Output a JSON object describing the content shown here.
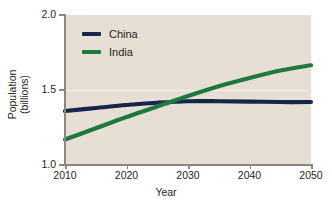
{
  "chart_data": {
    "type": "line",
    "title": "",
    "xlabel": "Year",
    "ylabel": "Population\n(billions)",
    "ylabel_line1": "Population",
    "ylabel_line2": "(billions)",
    "xlim": [
      2010,
      2050
    ],
    "ylim": [
      1.0,
      2.0
    ],
    "xticks": [
      2010,
      2020,
      2030,
      2040,
      2050
    ],
    "xticklabels": [
      "2010",
      "2020",
      "2030",
      "2040",
      "2050"
    ],
    "yticks": [
      1.0,
      1.5,
      2.0
    ],
    "yticklabels": [
      "1.0",
      "1.5",
      "2.0"
    ],
    "grid": "horizontal-faint",
    "legend_position": "top-left-inside",
    "plot_background": "#e7ded4",
    "figure_background": "#ffffff",
    "series": [
      {
        "name": "China",
        "color": "#17254c",
        "x": [
          2010,
          2015,
          2020,
          2025,
          2030,
          2035,
          2040,
          2045,
          2050
        ],
        "values": [
          1.36,
          1.38,
          1.4,
          1.415,
          1.425,
          1.425,
          1.423,
          1.42,
          1.42
        ]
      },
      {
        "name": "India",
        "color": "#1b7a3d",
        "x": [
          2010,
          2015,
          2020,
          2025,
          2030,
          2035,
          2040,
          2045,
          2050
        ],
        "values": [
          1.17,
          1.245,
          1.32,
          1.39,
          1.46,
          1.525,
          1.58,
          1.63,
          1.665
        ]
      }
    ],
    "annotations": [],
    "legend": [
      {
        "label": "China",
        "color": "#17254c"
      },
      {
        "label": "India",
        "color": "#1b7a3d"
      }
    ]
  }
}
